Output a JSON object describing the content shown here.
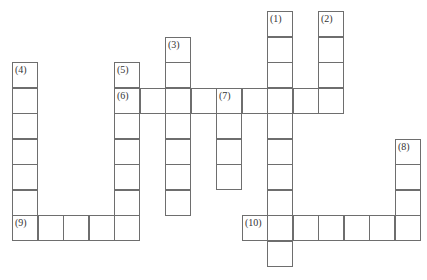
{
  "puzzle": {
    "type": "crossword",
    "cell_size": 25.5,
    "origin": {
      "x": 12,
      "y": 11
    },
    "line_color": "#6e6e6e",
    "label_color": "#333333",
    "entries": [
      {
        "number": "(1)",
        "label": "(1)",
        "direction": "down",
        "col": 10,
        "row": 0,
        "length": 10
      },
      {
        "number": "(2)",
        "label": "(2)",
        "direction": "down",
        "col": 12,
        "row": 0,
        "length": 4
      },
      {
        "number": "(3)",
        "label": "(3)",
        "direction": "down",
        "col": 6,
        "row": 1,
        "length": 7
      },
      {
        "number": "(4)",
        "label": "(4)",
        "direction": "down",
        "col": 0,
        "row": 2,
        "length": 7
      },
      {
        "number": "(5)",
        "label": "(5)",
        "direction": "down",
        "col": 4,
        "row": 2,
        "length": 7
      },
      {
        "number": "(6)",
        "label": "(6)",
        "direction": "across",
        "col": 4,
        "row": 3,
        "length": 9
      },
      {
        "number": "(7)",
        "label": "(7)",
        "direction": "down",
        "col": 8,
        "row": 3,
        "length": 4
      },
      {
        "number": "(8)",
        "label": "(8)",
        "direction": "down",
        "col": 15,
        "row": 5,
        "length": 4
      },
      {
        "number": "(9)",
        "label": "(9)",
        "direction": "across",
        "col": 0,
        "row": 8,
        "length": 5
      },
      {
        "number": "(10)",
        "label": "(10)",
        "direction": "across",
        "col": 9,
        "row": 8,
        "length": 7
      }
    ]
  }
}
